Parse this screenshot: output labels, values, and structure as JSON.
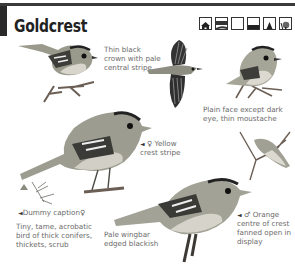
{
  "header": {
    "title": "Goldcrest",
    "habitat_icons": [
      {
        "name": "house-icon",
        "label": "Gardens"
      },
      {
        "name": "hedge-field-icon",
        "label": "Farmland"
      },
      {
        "name": "open-ground-icon",
        "label": "Open ground"
      },
      {
        "name": "dense-cover-icon",
        "label": "Dense cover"
      },
      {
        "name": "conifer-icon",
        "label": "Coniferous woodland"
      },
      {
        "name": "broadleaf-tree-icon",
        "label": "Woodland"
      }
    ]
  },
  "captions": {
    "crown": "Thin black crown with pale central stripe",
    "face": "Plain face except dark eye, thin moustache",
    "female": {
      "marker": "◄",
      "sex": "♀",
      "text": "Yellow crest stripe"
    },
    "dummy": {
      "marker": "◄",
      "text": "Dummy caption",
      "sex": "♀"
    },
    "description": "Tiny, tame, acrobatic bird of thick conifers, thickets, scrub",
    "wingbar": "Pale wingbar edged blackish",
    "male": {
      "marker": "◄",
      "sex": "♂",
      "text": "Orange centre of crest fanned open in display"
    }
  },
  "illustrations": [
    {
      "name": "goldcrest-perched-top-left"
    },
    {
      "name": "goldcrest-flying"
    },
    {
      "name": "goldcrest-perched-top-right"
    },
    {
      "name": "goldcrest-female-large"
    },
    {
      "name": "goldcrest-hanging"
    },
    {
      "name": "goldcrest-male-large"
    },
    {
      "name": "goldcrest-tiny-distant"
    }
  ]
}
